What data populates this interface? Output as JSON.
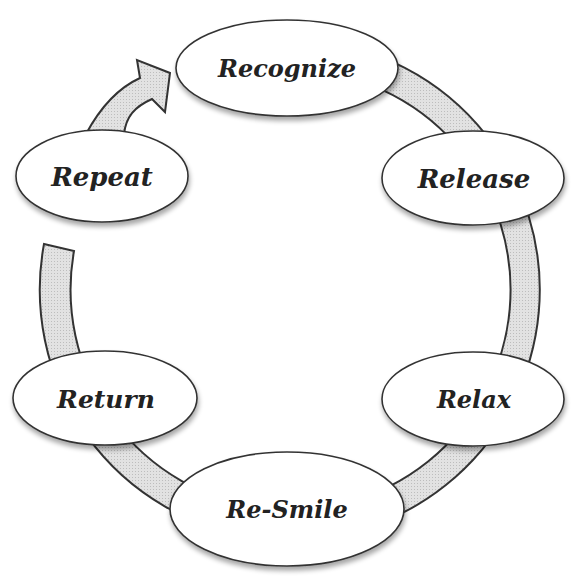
{
  "diagram": {
    "type": "cycle",
    "colors": {
      "band_fill": "#d9d9d9",
      "stroke": "#333333",
      "node_fill": "#ffffff",
      "text": "#222222"
    },
    "nodes": [
      {
        "id": "recognize",
        "label": "Recognize",
        "cx": 287,
        "cy": 68,
        "rx": 111,
        "ry": 48,
        "font_size": 24
      },
      {
        "id": "release",
        "label": "Release",
        "cx": 473,
        "cy": 178,
        "rx": 91,
        "ry": 47,
        "font_size": 27
      },
      {
        "id": "relax",
        "label": "Relax",
        "cx": 473,
        "cy": 399,
        "rx": 91,
        "ry": 47,
        "font_size": 25
      },
      {
        "id": "re-smile",
        "label": "Re-Smile",
        "cx": 287,
        "cy": 509,
        "rx": 117,
        "ry": 57,
        "font_size": 25
      },
      {
        "id": "return",
        "label": "Return",
        "cx": 105,
        "cy": 398,
        "rx": 92,
        "ry": 47,
        "font_size": 26
      },
      {
        "id": "repeat",
        "label": "Repeat",
        "cx": 102,
        "cy": 176,
        "rx": 86,
        "ry": 46,
        "font_size": 27
      }
    ],
    "flow_order": [
      "Recognize",
      "Release",
      "Relax",
      "Re-Smile",
      "Return",
      "Repeat"
    ],
    "arrow": {
      "from": "Repeat",
      "to": "Recognize"
    }
  }
}
